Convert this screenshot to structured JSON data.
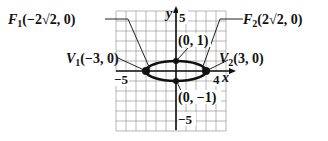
{
  "diagram": {
    "type": "ellipse-graph",
    "ellipse": {
      "center": [
        0,
        0
      ],
      "a": 3,
      "b": 1
    },
    "grid": {
      "xmin": -6,
      "xmax": 5,
      "ymin": -6,
      "ymax": 6
    },
    "axes": {
      "x_label": "x",
      "y_label": "y"
    },
    "ticks": {
      "x_neg": "−5",
      "x_pos": "4",
      "y_pos": "5",
      "y_neg": "−5"
    },
    "points": [
      {
        "id": "v1",
        "x": -3,
        "y": 0,
        "label": "V1(−3, 0)"
      },
      {
        "id": "v2",
        "x": 3,
        "y": 0,
        "label": "V2(3, 0)"
      },
      {
        "id": "top",
        "x": 0,
        "y": 1,
        "label": "(0, 1)"
      },
      {
        "id": "bottom",
        "x": 0,
        "y": -1,
        "label": "(0, −1)"
      }
    ],
    "foci": [
      {
        "id": "f1",
        "label": "F1(−2√2, 0)"
      },
      {
        "id": "f2",
        "label": "F2(2√2, 0)"
      }
    ],
    "labels": {
      "f1_main": "F",
      "f1_sub": "1",
      "f1_rest": "(−2√2, 0)",
      "f2_main": "F",
      "f2_sub": "2",
      "f2_rest": "(2√2, 0)",
      "v1_main": "V",
      "v1_sub": "1",
      "v1_rest": "(−3, 0)",
      "v2_main": "V",
      "v2_sub": "2",
      "v2_rest": "(3, 0)",
      "top": "(0, 1)",
      "bottom": "(0, −1)"
    }
  }
}
